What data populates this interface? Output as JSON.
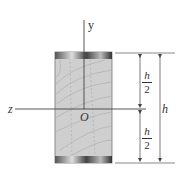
{
  "figure": {
    "axes": {
      "y_label": "y",
      "z_label": "z",
      "origin_label": "O"
    },
    "dimensions": {
      "upper_half": {
        "numerator": "h",
        "denominator": "2"
      },
      "lower_half": {
        "numerator": "h",
        "denominator": "2"
      },
      "total": "h"
    },
    "colors": {
      "wood_fill": "#cfcfcf",
      "grain": "#a8a8a8",
      "edge_dark": "#3a3a3a",
      "line": "#444444"
    }
  }
}
